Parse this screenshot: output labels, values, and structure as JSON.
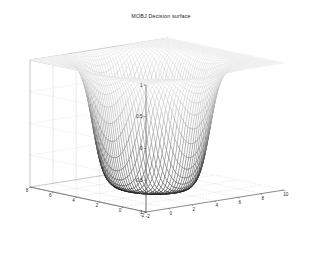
{
  "figure": {
    "background_color": "#ffffff",
    "title": "MOBJ Decision surface"
  },
  "axes": {
    "x": {
      "label": "",
      "ticks": [
        "-2",
        "0",
        "2",
        "4",
        "6",
        "8",
        "10"
      ],
      "values": [
        -2,
        0,
        2,
        4,
        6,
        8,
        10
      ],
      "range": [
        -2,
        10
      ]
    },
    "y": {
      "label": "",
      "ticks": [
        "-2",
        "0",
        "2",
        "4",
        "6",
        "8"
      ],
      "values": [
        -2,
        0,
        2,
        4,
        6,
        8
      ],
      "range": [
        -2,
        8
      ]
    },
    "z": {
      "label": "",
      "ticks": [
        "-1",
        "-0.5",
        "0",
        "0.5",
        "1"
      ],
      "values": [
        -1,
        -0.5,
        0,
        0.5,
        1
      ],
      "range": [
        -1,
        1
      ]
    }
  },
  "chart_data": {
    "type": "surface",
    "title": "MOBJ Decision surface",
    "xlabel": "",
    "ylabel": "",
    "zlabel": "",
    "xlim": [
      -2,
      10
    ],
    "ylim": [
      -2,
      8
    ],
    "zlim": [
      -1,
      1
    ],
    "xticks": [
      -2,
      0,
      2,
      4,
      6,
      8,
      10
    ],
    "yticks": [
      -2,
      0,
      2,
      4,
      6,
      8
    ],
    "zticks": [
      -1,
      -0.5,
      0,
      0.5,
      1
    ],
    "grid": true,
    "legend": null,
    "colormap": "gray",
    "render_style": "mesh-wireframe",
    "mesh_nx": 60,
    "mesh_ny": 60,
    "surface_description": "Saturating bowl-shaped decision surface: z = tanh-like sigmoid of a radial quadratic, clipped between -1 and 1. Flat plateau at z = 1 across outer region, steep walls descending to a flat floor at z = -1 near the centre of the x-y domain.",
    "z_plateau_high": 1,
    "z_plateau_low": -1,
    "center_x": 3.5,
    "center_y": 3.0,
    "radius": 3.6,
    "steepness": 1.6,
    "view_azimuth": -37.5,
    "view_elevation": 30,
    "box_corners_px": {
      "origin_front_bottom": [
        146,
        212
      ],
      "left_bottom": [
        30,
        187
      ],
      "right_bottom": [
        284,
        190
      ],
      "back_bottom": [
        170,
        166
      ],
      "left_top": [
        30,
        60
      ],
      "origin_front_top": [
        146,
        85
      ],
      "right_top": [
        284,
        63
      ],
      "back_top": [
        170,
        39
      ]
    }
  }
}
